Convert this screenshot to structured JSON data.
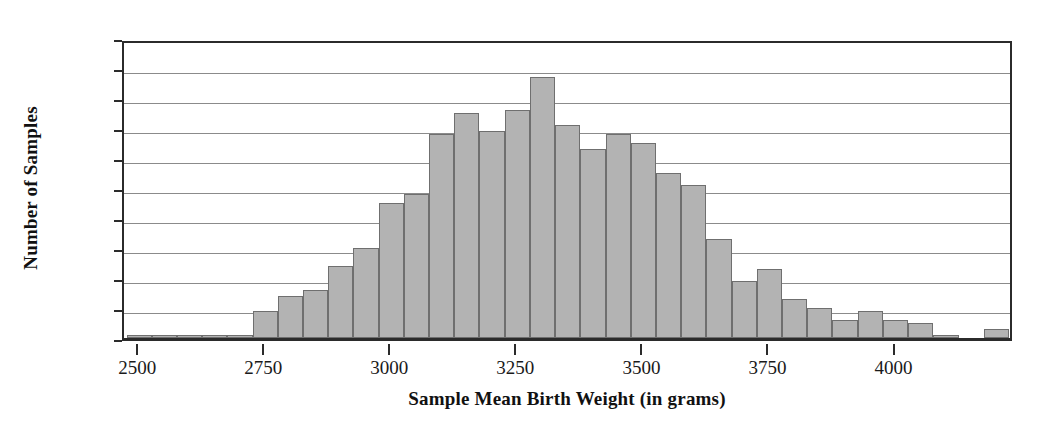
{
  "chart_data": {
    "type": "bar",
    "title": "",
    "xlabel": "Sample Mean Birth Weight (in grams)",
    "ylabel": "Number of Samples",
    "xlim": [
      2470,
      4235
    ],
    "ylim": [
      0,
      100
    ],
    "grid": true,
    "legend": null,
    "bin_width": 50,
    "bar_color": "#b3b3b3",
    "bar_edge_color": "#6f6f6f",
    "axis_color": "#2b2b2b",
    "gridline_color": "#8b8b8b",
    "xticks": [
      2500,
      2750,
      3000,
      3250,
      3500,
      3750,
      4000
    ],
    "xtick_labels": [
      "2500",
      "2750",
      "3000",
      "3250",
      "3500",
      "3750",
      "4000"
    ],
    "yticks": [
      0,
      10,
      20,
      30,
      40,
      50,
      60,
      70,
      80,
      90,
      100
    ],
    "ytick_labels": [
      "0",
      "10",
      "20",
      "30",
      "40",
      "50",
      "60",
      "70",
      "80",
      "90",
      "100"
    ],
    "bin_starts": [
      2475,
      2525,
      2575,
      2625,
      2675,
      2725,
      2775,
      2825,
      2875,
      2925,
      2975,
      3025,
      3075,
      3125,
      3175,
      3225,
      3275,
      3325,
      3375,
      3425,
      3475,
      3525,
      3575,
      3625,
      3675,
      3725,
      3775,
      3825,
      3875,
      3925,
      3975,
      4025,
      4075,
      4125,
      4175
    ],
    "categories": [
      "2475-2525",
      "2525-2575",
      "2575-2625",
      "2625-2675",
      "2675-2725",
      "2725-2775",
      "2775-2825",
      "2825-2875",
      "2875-2925",
      "2925-2975",
      "2975-3025",
      "3025-3075",
      "3075-3125",
      "3125-3175",
      "3175-3225",
      "3225-3275",
      "3275-3325",
      "3325-3375",
      "3375-3425",
      "3425-3475",
      "3475-3525",
      "3525-3575",
      "3575-3625",
      "3625-3675",
      "3675-3725",
      "3725-3775",
      "3775-3825",
      "3825-3875",
      "3875-3925",
      "3925-3975",
      "3975-4025",
      "4025-4075",
      "4075-4125",
      "4125-4175",
      "4175-4225"
    ],
    "values": [
      1,
      1,
      1,
      1,
      1,
      9,
      14,
      16,
      24,
      30,
      45,
      48,
      68,
      75,
      69,
      76,
      87,
      71,
      63,
      68,
      65,
      55,
      51,
      33,
      19,
      23,
      13,
      10,
      6,
      9,
      6,
      5,
      1,
      0,
      3
    ]
  }
}
